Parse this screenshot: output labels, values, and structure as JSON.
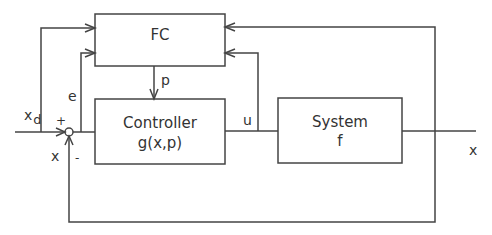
{
  "diagram": {
    "type": "control-block-diagram",
    "blocks": {
      "fc": {
        "label": "FC"
      },
      "controller": {
        "label": "Controller",
        "function": "g(x,p)"
      },
      "system": {
        "label": "System",
        "function": "f"
      }
    },
    "summing_junction": {
      "plus_sign": "+",
      "minus_sign": "-"
    },
    "signals": {
      "xd_main": "x",
      "xd_sub": "d",
      "error": "e",
      "param": "p",
      "control": "u",
      "output": "x",
      "feedback": "x"
    }
  },
  "colors": {
    "line": "#444444",
    "text": "#333333",
    "background": "#ffffff"
  }
}
